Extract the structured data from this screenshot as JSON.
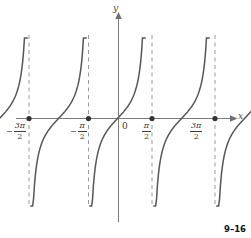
{
  "figure": {
    "number": "9–16",
    "axes": {
      "x_label": "x",
      "y_label": "y",
      "origin_label": "0"
    },
    "tick_labels": [
      {
        "id": "neg-3pi-2",
        "minus": "−",
        "numerator": "3π",
        "denominator": "2",
        "x_value": -4.712
      },
      {
        "id": "neg-pi-2",
        "minus": "−",
        "numerator": "π",
        "denominator": "2",
        "x_value": -1.571
      },
      {
        "id": "pi-2",
        "minus": "",
        "numerator": "π",
        "denominator": "2",
        "x_value": 1.571
      },
      {
        "id": "3pi-2",
        "minus": "",
        "numerator": "3π",
        "denominator": "2",
        "x_value": 4.712
      }
    ],
    "colors": {
      "curve": "#575757",
      "asymptote": "#9a9a9a",
      "axis": "#7a7a7a",
      "point": "#333333",
      "text": "#3d3d3d"
    }
  },
  "chart_data": {
    "type": "line",
    "title": "",
    "subtitle": "",
    "xlabel": "x",
    "ylabel": "y",
    "function": "y = tan(x)",
    "xlim": [
      -6.283,
      6.283
    ],
    "ylim": [
      -4.2,
      4.2
    ],
    "grid": false,
    "legend": null,
    "x_ticks": [
      "-3π/2",
      "-π/2",
      "0",
      "π/2",
      "3π/2"
    ],
    "x_tick_values": [
      -4.712,
      -1.571,
      0,
      1.571,
      4.712
    ],
    "y_ticks": [],
    "marked_points": [
      {
        "x": -4.712,
        "y": 0
      },
      {
        "x": -1.571,
        "y": 0
      },
      {
        "x": 1.571,
        "y": 0
      },
      {
        "x": 4.712,
        "y": 0
      }
    ],
    "asymptotes": [
      -3.1416,
      -1.0472,
      0.5236,
      2.0944
    ],
    "asymptote_labels": [
      "x = -3π/2 + shift",
      "",
      "",
      ""
    ],
    "vertical_dashed_x_px": [
      29,
      88,
      152,
      215
    ],
    "branches": [
      {
        "name": "branch-1",
        "x_range": [
          -5.1,
          -3.6
        ],
        "note": "tangent branch left of first asymptote pair"
      },
      {
        "name": "branch-2",
        "x_range": [
          -3.0,
          -1.5
        ],
        "note": "tangent branch ending at x=-π/2 region"
      },
      {
        "name": "branch-3",
        "x_range": [
          -0.9,
          0.6
        ],
        "note": "central branch through origin"
      },
      {
        "name": "branch-4",
        "x_range": [
          1.2,
          2.7
        ],
        "note": "tangent branch right of π/2"
      }
    ],
    "series": [
      {
        "name": "y = tan(x)",
        "values": [],
        "color": "#575757"
      }
    ]
  }
}
